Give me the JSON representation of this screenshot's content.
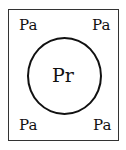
{
  "diagram": {
    "outer_box": {
      "label": ""
    },
    "corner_labels": {
      "top_left": "Pa",
      "top_right": "Pa",
      "bottom_left": "Pa",
      "bottom_right": "Pa"
    },
    "circle": {
      "label": "Pr"
    }
  }
}
